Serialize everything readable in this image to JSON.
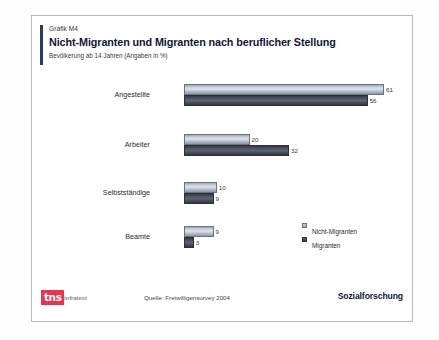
{
  "slide": {
    "kicker": "Grafik M4",
    "headline": "Nicht-Migranten und Migranten nach beruflicher Stellung",
    "subline": "Bevölkerung ab 14 Jahren (Angaben in %)"
  },
  "footer": {
    "logo_mark": "tns",
    "logo_word": "infratest",
    "source": "Quelle: Freiwilligensurvey 2004",
    "brandline": "Sozialforschung"
  },
  "colors": {
    "accent_bar": "#2b3a63",
    "logo_red": "#e8344e",
    "series_light": "#c6cedb",
    "series_dark": "#4b515f",
    "card_border": "#b9b9b9"
  },
  "chart_data": {
    "type": "bar",
    "orientation": "horizontal",
    "title": "Nicht-Migranten und Migranten nach beruflicher Stellung",
    "subtitle": "Bevölkerung ab 14 Jahren (Angaben in %)",
    "xlabel": "",
    "ylabel": "",
    "xlim": [
      0,
      65
    ],
    "grid": false,
    "legend_position": "right",
    "categories": [
      "Angestellte",
      "Arbeiter",
      "Selbstständige",
      "Beamte"
    ],
    "series": [
      {
        "name": "Nicht-Migranten",
        "values": [
          61,
          20,
          10,
          9
        ]
      },
      {
        "name": "Migranten",
        "values": [
          56,
          32,
          9,
          3
        ]
      }
    ]
  }
}
